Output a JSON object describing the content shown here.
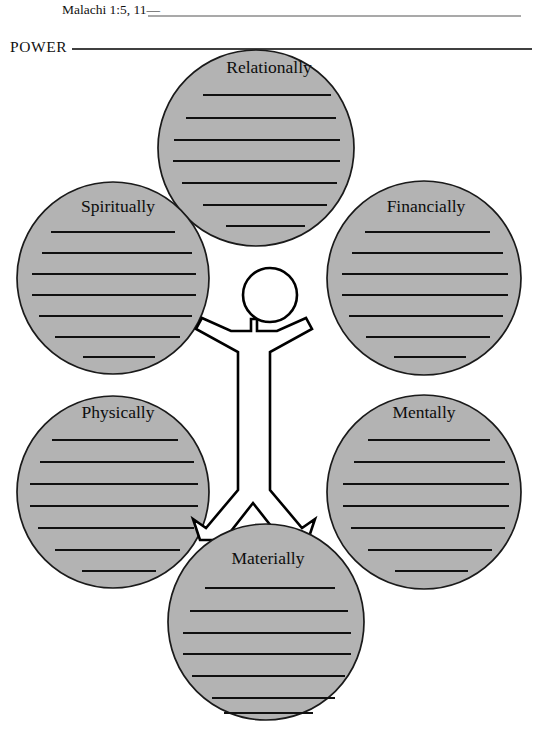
{
  "page": {
    "width": 536,
    "height": 744,
    "background_color": "#ffffff",
    "ink_color": "#000000"
  },
  "header": {
    "scripture_reference": "Malachi 1:5, 11—",
    "scripture_blank_line": true,
    "section_label": "POWER",
    "section_blank_line": true
  },
  "diagram": {
    "type": "radial-worksheet",
    "center_figure": {
      "name": "person-outline",
      "description": "outlined human figure with arms outstretched and legs apart",
      "fill_color": "#ffffff",
      "outline_color": "#000000"
    },
    "bubble_fill_color": "#b3b3b3",
    "bubble_outline_color": "#1a1a1a",
    "writing_lines_per_bubble": 7,
    "bubbles": [
      {
        "id": "relationally",
        "label": "Relationally",
        "position": "top",
        "cx": 256,
        "cy": 148,
        "r": 98
      },
      {
        "id": "spiritually",
        "label": "Spiritually",
        "position": "upper-left",
        "cx": 113,
        "cy": 278,
        "r": 96
      },
      {
        "id": "financially",
        "label": "Financially",
        "position": "upper-right",
        "cx": 424,
        "cy": 278,
        "r": 97
      },
      {
        "id": "physically",
        "label": "Physically",
        "position": "lower-left",
        "cx": 113,
        "cy": 492,
        "r": 96
      },
      {
        "id": "mentally",
        "label": "Mentally",
        "position": "lower-right",
        "cx": 424,
        "cy": 492,
        "r": 97
      },
      {
        "id": "materially",
        "label": "Materially",
        "position": "bottom",
        "cx": 266,
        "cy": 622,
        "r": 98
      }
    ]
  }
}
